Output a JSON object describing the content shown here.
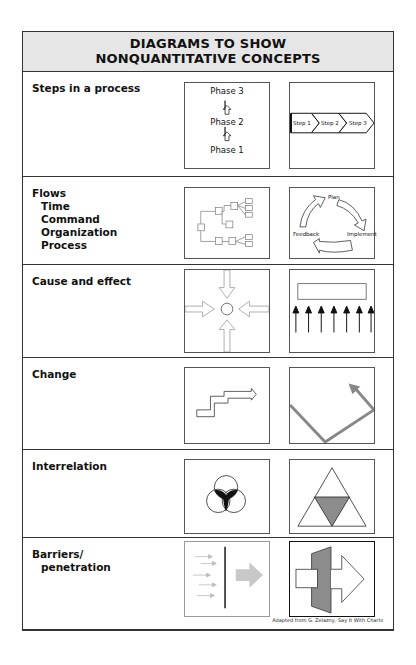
{
  "header": {
    "line1": "DIAGRAMS TO SHOW",
    "line2": "NONQUANTITATIVE CONCEPTS"
  },
  "rows": [
    {
      "label": "Steps in a process",
      "sublabels": [],
      "left_diagram": {
        "type": "vertical-phases",
        "phases": [
          "Phase 3",
          "Phase 2",
          "Phase 1"
        ]
      },
      "right_diagram": {
        "type": "chevron-steps",
        "steps": [
          "Step 1",
          "Step 2",
          "Step 3"
        ]
      }
    },
    {
      "label": "Flows",
      "sublabels": [
        "Time",
        "Command",
        "Organization",
        "Process"
      ],
      "left_diagram": {
        "type": "tree-flow"
      },
      "right_diagram": {
        "type": "cycle",
        "nodes": [
          "Plan",
          "Implement",
          "Feedback"
        ]
      }
    },
    {
      "label": "Cause and effect",
      "sublabels": [],
      "left_diagram": {
        "type": "converging-arrows"
      },
      "right_diagram": {
        "type": "arrows-to-bar",
        "arrow_count": 7
      }
    },
    {
      "label": "Change",
      "sublabels": [],
      "left_diagram": {
        "type": "stepped-arrow"
      },
      "right_diagram": {
        "type": "v-line-arrow"
      }
    },
    {
      "label": "Interrelation",
      "sublabels": [],
      "left_diagram": {
        "type": "three-circles"
      },
      "right_diagram": {
        "type": "nested-triangle"
      }
    },
    {
      "label": "Barriers/",
      "sublabels": [
        "penetration"
      ],
      "left_diagram": {
        "type": "arrows-blocked-by-barrier"
      },
      "right_diagram": {
        "type": "arrow-through-wall"
      }
    }
  ],
  "credit": "Adapted from G. Zelazny, Say It With Charts",
  "colors": {
    "header_bg": "#e6e6e6",
    "border": "#333333",
    "shade_gray": "#8c8c8c",
    "light_gray": "#c8c8c8"
  }
}
